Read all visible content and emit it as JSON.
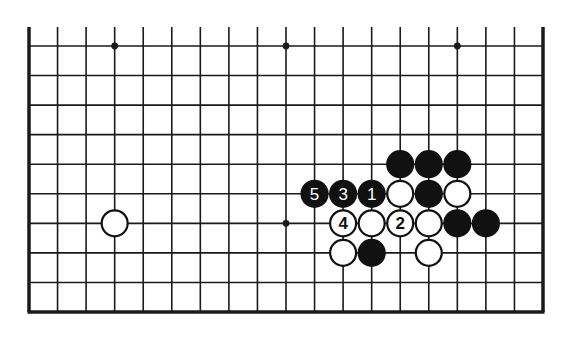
{
  "diagram": {
    "type": "go-board-partial",
    "columns": 19,
    "visible_rows": 10,
    "edges": {
      "left": true,
      "right": true,
      "bottom": true,
      "top": false
    },
    "colors": {
      "line": "#1a1a1a",
      "black_stone": "#111111",
      "white_stone": "#ffffff",
      "background": "#ffffff",
      "label_on_black": "#ffffff",
      "label_on_white": "#111111"
    },
    "star_points": [
      {
        "col": 3,
        "row": 0
      },
      {
        "col": 9,
        "row": 0
      },
      {
        "col": 15,
        "row": 0
      },
      {
        "col": 9,
        "row": 6
      }
    ],
    "stones": [
      {
        "col": 13,
        "row": 4,
        "color": "black",
        "label": ""
      },
      {
        "col": 14,
        "row": 4,
        "color": "black",
        "label": ""
      },
      {
        "col": 15,
        "row": 4,
        "color": "black",
        "label": ""
      },
      {
        "col": 10,
        "row": 5,
        "color": "black",
        "label": "5"
      },
      {
        "col": 11,
        "row": 5,
        "color": "black",
        "label": "3"
      },
      {
        "col": 12,
        "row": 5,
        "color": "black",
        "label": "1"
      },
      {
        "col": 13,
        "row": 5,
        "color": "white",
        "label": ""
      },
      {
        "col": 14,
        "row": 5,
        "color": "black",
        "label": ""
      },
      {
        "col": 15,
        "row": 5,
        "color": "white",
        "label": ""
      },
      {
        "col": 3,
        "row": 6,
        "color": "white",
        "label": ""
      },
      {
        "col": 11,
        "row": 6,
        "color": "white",
        "label": "4"
      },
      {
        "col": 12,
        "row": 6,
        "color": "white",
        "label": ""
      },
      {
        "col": 13,
        "row": 6,
        "color": "white",
        "label": "2"
      },
      {
        "col": 14,
        "row": 6,
        "color": "white",
        "label": ""
      },
      {
        "col": 15,
        "row": 6,
        "color": "black",
        "label": ""
      },
      {
        "col": 16,
        "row": 6,
        "color": "black",
        "label": ""
      },
      {
        "col": 11,
        "row": 7,
        "color": "white",
        "label": ""
      },
      {
        "col": 12,
        "row": 7,
        "color": "black",
        "label": ""
      },
      {
        "col": 14,
        "row": 7,
        "color": "white",
        "label": ""
      }
    ]
  }
}
